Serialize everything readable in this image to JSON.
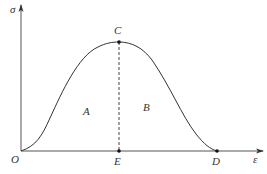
{
  "diagram": {
    "axes": {
      "y_label": "σ",
      "x_label": "ε",
      "origin_label": "O"
    },
    "points": {
      "C": "C",
      "E": "E",
      "D": "D"
    },
    "regions": {
      "A": "A",
      "B": "B"
    },
    "colors": {
      "line": "#333333",
      "background": "#ffffff"
    }
  }
}
